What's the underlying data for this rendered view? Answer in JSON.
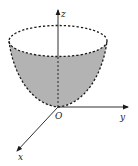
{
  "diagram": {
    "type": "3d-surface-sketch",
    "axes": {
      "z": {
        "label": "z"
      },
      "y": {
        "label": "y"
      },
      "x": {
        "label": "x"
      }
    },
    "origin_label": "O",
    "colors": {
      "surface_fill": "#b3b3b3",
      "stroke": "#1a1a1a",
      "background": "#ffffff"
    }
  }
}
